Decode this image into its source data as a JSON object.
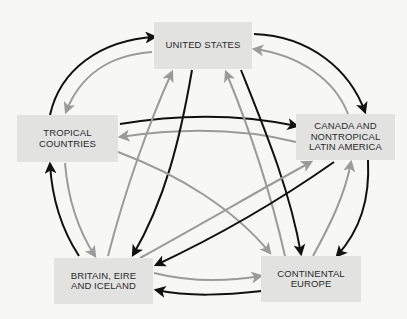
{
  "colors": {
    "background": "#f7f7f6",
    "node_fill": "#e2e2e1",
    "black_arrow": "#111111",
    "gray_arrow": "#9b9b9b"
  },
  "nodes": {
    "us": {
      "label": "UNITED STATES",
      "x": 154,
      "y": 22,
      "w": 98,
      "h": 47
    },
    "tropical": {
      "label": "TROPICAL\nCOUNTRIES",
      "x": 17,
      "y": 115,
      "w": 101,
      "h": 47
    },
    "canada": {
      "label": "CANADA AND\nNONTROPICAL\nLATIN AMERICA",
      "x": 296,
      "y": 114,
      "w": 99,
      "h": 46
    },
    "britain": {
      "label": "BRITAIN, EIRE\nAND ICELAND",
      "x": 54,
      "y": 258,
      "w": 99,
      "h": 46
    },
    "europe": {
      "label": "CONTINENTAL\nEUROPE",
      "x": 261,
      "y": 256,
      "w": 100,
      "h": 46
    }
  },
  "edges": [
    {
      "from": "tropical",
      "to": "us",
      "color": "black",
      "path": "M50,115 C60,70 100,40 155,37"
    },
    {
      "from": "us",
      "to": "tropical",
      "color": "gray",
      "path": "M152,52 C110,55 80,75 66,112"
    },
    {
      "from": "us",
      "to": "canada",
      "color": "black",
      "path": "M254,34 C310,36 350,70 365,112"
    },
    {
      "from": "canada",
      "to": "us",
      "color": "gray",
      "path": "M348,114 C335,80 300,55 254,49"
    },
    {
      "from": "tropical",
      "to": "canada",
      "color": "black",
      "path": "M120,124 C180,114 240,114 297,126"
    },
    {
      "from": "canada",
      "to": "tropical",
      "color": "gray",
      "path": "M296,142 C240,128 180,128 120,137"
    },
    {
      "from": "britain",
      "to": "us",
      "color": "gray",
      "path": "M108,256 C125,190 150,120 172,72"
    },
    {
      "from": "us",
      "to": "britain",
      "color": "black",
      "path": "M192,70 C180,140 165,200 133,255"
    },
    {
      "from": "europe",
      "to": "us",
      "color": "gray",
      "path": "M285,256 C270,190 250,130 226,72"
    },
    {
      "from": "us",
      "to": "europe",
      "color": "black",
      "path": "M241,70 C265,130 290,190 301,254"
    },
    {
      "from": "tropical",
      "to": "europe",
      "color": "gray",
      "path": "M118,152 C180,175 235,210 270,253"
    },
    {
      "from": "britain",
      "to": "canada",
      "color": "gray",
      "path": "M140,258 C200,225 260,190 311,162"
    },
    {
      "from": "canada",
      "to": "britain",
      "color": "black",
      "path": "M334,162 C280,200 220,235 156,265"
    },
    {
      "from": "europe",
      "to": "canada",
      "color": "gray",
      "path": "M313,256 C330,225 345,195 351,162"
    },
    {
      "from": "canada",
      "to": "europe",
      "color": "black",
      "path": "M368,160 C370,200 360,230 337,256"
    },
    {
      "from": "britain",
      "to": "tropical",
      "color": "black",
      "path": "M79,256 C62,230 52,200 50,164"
    },
    {
      "from": "tropical",
      "to": "britain",
      "color": "gray",
      "path": "M65,163 C68,200 78,230 95,256"
    },
    {
      "from": "britain",
      "to": "europe",
      "color": "gray",
      "path": "M154,273 C190,282 225,282 261,276"
    },
    {
      "from": "europe",
      "to": "britain",
      "color": "black",
      "path": "M262,291 C225,295 190,297 156,290"
    }
  ]
}
